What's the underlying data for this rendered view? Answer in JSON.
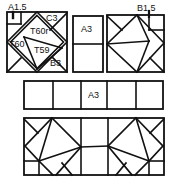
{
  "diagram": {
    "type": "quilt-block-assembly",
    "line_color": "#111111",
    "background": "#ffffff",
    "top_left_block": {
      "labels": {
        "a15": "A1.5",
        "c3": "C3",
        "t60r": "T60r",
        "t60": "T60",
        "t59": "T59",
        "b3": "B3"
      }
    },
    "center_block": {
      "label": "A3"
    },
    "top_right_block": {
      "label": "B1.5"
    },
    "middle_strip": {
      "cells": 5,
      "center_label": "A3"
    },
    "bottom_strip": {
      "description": "two mirrored diamond blocks joined by center rectangles"
    }
  }
}
